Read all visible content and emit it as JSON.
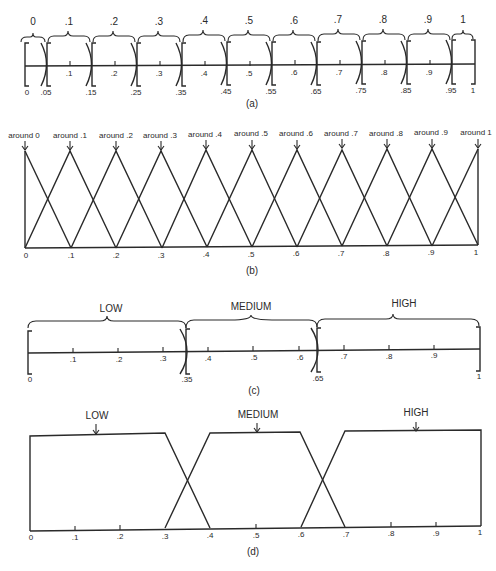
{
  "panels": {
    "a": {
      "caption": "(a)",
      "top_labels": [
        "0",
        ".1",
        ".2",
        ".3",
        ".4",
        ".5",
        ".6",
        ".7",
        ".8",
        ".9",
        "1"
      ],
      "tick_labels": [
        ".1",
        ".2",
        ".3",
        ".4",
        ".5",
        ".6",
        ".7",
        ".8",
        ".9"
      ],
      "boundary_labels": [
        "0",
        ".05",
        ".15",
        ".25",
        ".35",
        ".45",
        ".55",
        ".65",
        ".75",
        ".85",
        ".95",
        "1"
      ]
    },
    "b": {
      "caption": "(b)",
      "peak_labels": [
        "around 0",
        "around .1",
        "around .2",
        "around .3",
        "around .4",
        "around .5",
        "around .6",
        "around .7",
        "around .8",
        "around .9",
        "around 1"
      ],
      "axis_labels": [
        "0",
        ".1",
        ".2",
        ".3",
        ".4",
        ".5",
        ".6",
        ".7",
        ".8",
        ".9",
        "1"
      ]
    },
    "c": {
      "caption": "(c)",
      "set_labels": [
        "LOW",
        "MEDIUM",
        "HIGH"
      ],
      "tick_labels": [
        ".1",
        ".2",
        ".3",
        ".4",
        ".5",
        ".6",
        ".7",
        ".8",
        ".9"
      ],
      "boundary_labels": [
        "0",
        ".35",
        ".65",
        "1"
      ]
    },
    "d": {
      "caption": "(d)",
      "set_labels": [
        "LOW",
        "MEDIUM",
        "HIGH"
      ],
      "axis_labels": [
        "0",
        ".1",
        ".2",
        ".3",
        ".4",
        ".5",
        ".6",
        ".7",
        ".8",
        ".9",
        "1"
      ]
    }
  }
}
